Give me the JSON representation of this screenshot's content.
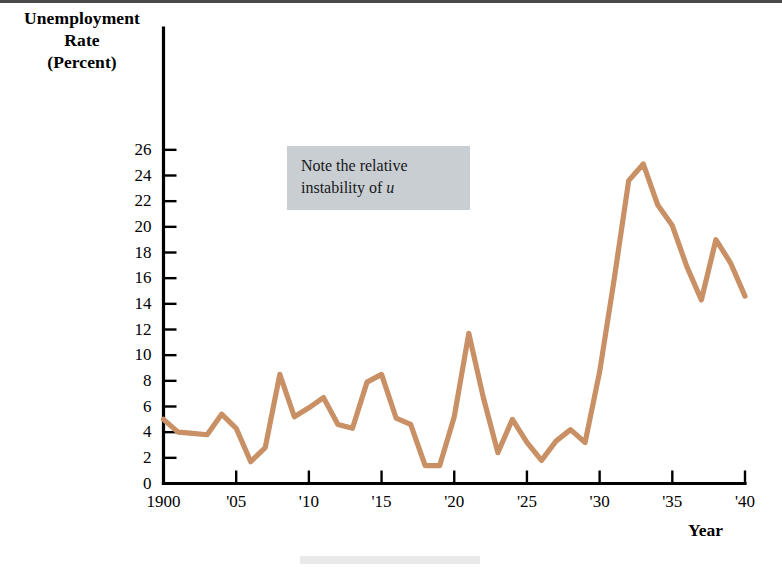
{
  "figure": {
    "y_axis_title_lines": [
      "Unemployment",
      "Rate",
      "(Percent)"
    ],
    "x_axis_title": "Year",
    "annotation": {
      "line1": "Note the relative",
      "line2_prefix": "instability of ",
      "line2_italic": "u"
    },
    "line_color": "#c89064",
    "axis_color": "#000000",
    "annotation_bg": "#c9ced3"
  },
  "chart_data": {
    "type": "line",
    "title": "",
    "xlabel": "Year",
    "ylabel": "Unemployment Rate (Percent)",
    "xlim": [
      1900,
      1940
    ],
    "ylim": [
      0,
      27
    ],
    "grid": false,
    "legend": "none",
    "y_ticks": [
      0,
      2,
      4,
      6,
      8,
      10,
      12,
      14,
      16,
      18,
      20,
      22,
      24,
      26
    ],
    "y_tick_labels": [
      "0",
      "2",
      "4",
      "6",
      "8",
      "10",
      "12",
      "14",
      "16",
      "18",
      "20",
      "22",
      "24",
      "26"
    ],
    "x_ticks": [
      1900,
      1905,
      1910,
      1915,
      1920,
      1925,
      1930,
      1935,
      1940
    ],
    "x_tick_labels": [
      "1900",
      "'05",
      "'10",
      "'15",
      "'20",
      "'25",
      "'30",
      "'35",
      "'40"
    ],
    "x": [
      1900,
      1901,
      1902,
      1903,
      1904,
      1905,
      1906,
      1907,
      1908,
      1909,
      1910,
      1911,
      1912,
      1913,
      1914,
      1915,
      1916,
      1917,
      1918,
      1919,
      1920,
      1921,
      1922,
      1923,
      1924,
      1925,
      1926,
      1927,
      1928,
      1929,
      1930,
      1931,
      1932,
      1933,
      1934,
      1935,
      1936,
      1937,
      1938,
      1939,
      1940
    ],
    "values": [
      5.0,
      4.0,
      3.9,
      3.8,
      5.4,
      4.3,
      1.7,
      2.8,
      8.5,
      5.2,
      5.9,
      6.7,
      4.6,
      4.3,
      7.9,
      8.5,
      5.1,
      4.6,
      1.4,
      1.4,
      5.2,
      11.7,
      6.7,
      2.4,
      5.0,
      3.2,
      1.8,
      3.3,
      4.2,
      3.2,
      8.7,
      15.9,
      23.6,
      24.9,
      21.7,
      20.1,
      16.9,
      14.3,
      19.0,
      17.2,
      14.6
    ],
    "annotations": [
      {
        "text": "Note the relative instability of u",
        "x_range": [
          1910,
          1925
        ],
        "y_range": [
          21,
          26
        ]
      }
    ]
  }
}
